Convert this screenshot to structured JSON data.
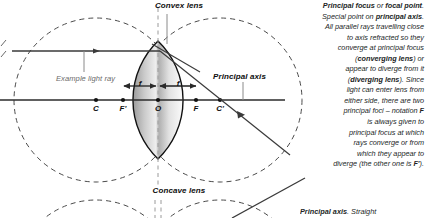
{
  "page": {
    "background": "#ffffff",
    "width": 425,
    "height": 218
  },
  "diagram": {
    "convex": {
      "title": "Convex lens",
      "ray_label": "Example light ray",
      "axis_label": "Principal axis",
      "focal_marker_left": "f",
      "focal_marker_right": "f",
      "axis_points": [
        {
          "id": "C-left",
          "label": "C"
        },
        {
          "id": "F-prime",
          "label": "F'"
        },
        {
          "id": "O",
          "label": "O"
        },
        {
          "id": "F",
          "label": "F"
        },
        {
          "id": "C-right",
          "label": "C'"
        }
      ]
    },
    "concave": {
      "title": "Concave lens"
    },
    "colors": {
      "ink": "#1a1a1a",
      "construction": "#4a4a4a",
      "ray": "#3a3a3a",
      "label_gray": "#6b6b6b",
      "lens_light": "#f2f2f2",
      "lens_dark": "#8e8e8e"
    }
  },
  "notes": {
    "principal_focus": {
      "lines": [
        {
          "segments": [
            {
              "t": "Principal focus",
              "bold": true
            },
            {
              "t": " or ",
              "bold": false
            },
            {
              "t": "focal point",
              "bold": true
            },
            {
              "t": ".",
              "bold": false
            }
          ]
        },
        {
          "segments": [
            {
              "t": "Special point on ",
              "bold": false
            },
            {
              "t": "principal axis",
              "bold": true
            },
            {
              "t": ".",
              "bold": false
            }
          ]
        },
        {
          "segments": [
            {
              "t": "All parallel rays travelling close",
              "bold": false
            }
          ]
        },
        {
          "segments": [
            {
              "t": "to axis refracted so they",
              "bold": false
            }
          ]
        },
        {
          "segments": [
            {
              "t": "converge at principal focus",
              "bold": false
            }
          ]
        },
        {
          "segments": [
            {
              "t": "(",
              "bold": false
            },
            {
              "t": "converging lens",
              "bold": true
            },
            {
              "t": ") or",
              "bold": false
            }
          ]
        },
        {
          "segments": [
            {
              "t": "appear to diverge from it",
              "bold": false
            }
          ]
        },
        {
          "segments": [
            {
              "t": "(",
              "bold": false
            },
            {
              "t": "diverging lens",
              "bold": true
            },
            {
              "t": "). Since",
              "bold": false
            }
          ]
        },
        {
          "segments": [
            {
              "t": "light can enter lens from",
              "bold": false
            }
          ]
        },
        {
          "segments": [
            {
              "t": "either side, there are two",
              "bold": false
            }
          ]
        },
        {
          "segments": [
            {
              "t": "principal foci – notation ",
              "bold": false
            },
            {
              "t": "F",
              "bold": true
            }
          ]
        },
        {
          "segments": [
            {
              "t": "is always given to",
              "bold": false
            }
          ]
        },
        {
          "segments": [
            {
              "t": "principal focus at which",
              "bold": false
            }
          ]
        },
        {
          "segments": [
            {
              "t": "rays converge or from",
              "bold": false
            }
          ]
        },
        {
          "segments": [
            {
              "t": "which they appear to",
              "bold": false
            }
          ]
        },
        {
          "segments": [
            {
              "t": "diverge (the other one is ",
              "bold": false
            },
            {
              "t": "F'",
              "bold": true
            },
            {
              "t": ").",
              "bold": false
            }
          ]
        }
      ]
    },
    "principal_axis_note": {
      "segments": [
        {
          "t": "Principal axis",
          "bold": true
        },
        {
          "t": ". Straight",
          "bold": false
        }
      ]
    }
  }
}
